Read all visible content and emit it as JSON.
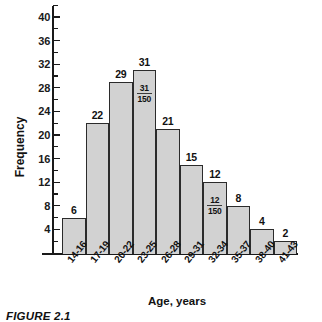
{
  "chart_data": {
    "type": "bar",
    "title": "",
    "xlabel": "Age, years",
    "ylabel": "Frequency",
    "categories": [
      "14-16",
      "17-19",
      "20-22",
      "23-25",
      "26-28",
      "29-31",
      "32-34",
      "35-37",
      "38-40",
      "41-43"
    ],
    "values": [
      6,
      22,
      29,
      31,
      21,
      15,
      12,
      8,
      4,
      2
    ],
    "value_labels": [
      "6",
      "22",
      "29",
      "31",
      "21",
      "15",
      "12",
      "8",
      "4",
      "2"
    ],
    "inner_labels": [
      {
        "index": 3,
        "numerator": "31",
        "denominator": "150"
      },
      {
        "index": 6,
        "numerator": "12",
        "denominator": "150"
      }
    ],
    "ylim": [
      0,
      42
    ],
    "y_major_ticks": [
      4,
      8,
      12,
      16,
      20,
      24,
      28,
      32,
      36,
      40
    ],
    "y_major_tick_labels": [
      "4",
      "8",
      "12",
      "16",
      "20",
      "24",
      "28",
      "32",
      "36",
      "40"
    ],
    "y_minor_ticks": [
      2,
      6,
      10,
      14,
      18,
      22,
      26,
      30,
      34,
      38,
      42
    ],
    "grid": false,
    "legend": false,
    "bar_fill_color": "#d2d2d2",
    "bar_edge_color": "#2b2b2b",
    "total_n": "150"
  },
  "caption": {
    "text": "FIGURE 2.1"
  }
}
